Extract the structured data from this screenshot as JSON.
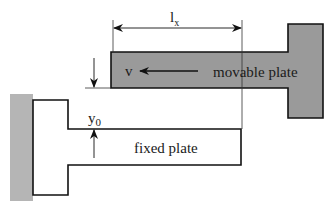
{
  "diagram": {
    "type": "parallel-plate-schematic",
    "labels": {
      "overlap_length": "l",
      "overlap_length_sub": "x",
      "velocity": "v",
      "movable_plate": "movable plate",
      "gap": "y",
      "gap_sub": "0",
      "fixed_plate": "fixed plate"
    },
    "colors": {
      "movable_fill": "#9a9a9a",
      "wall_fill": "#b5b5b5",
      "fixed_fill": "#ffffff",
      "stroke": "#111111"
    }
  }
}
